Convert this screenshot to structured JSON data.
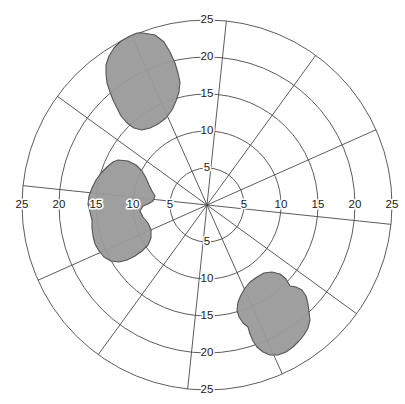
{
  "chart_data": {
    "type": "polar-region",
    "title": "",
    "subtitle": "",
    "xlabel": "",
    "ylabel": "",
    "grid": true,
    "legend": "none",
    "center": {
      "x": 207,
      "y": 205
    },
    "outer_radius_px": 185,
    "radial_axis": {
      "min": 0,
      "max": 25,
      "tick_step": 5,
      "tick_values": [
        5,
        10,
        15,
        20,
        25
      ],
      "tick_labels": [
        "5",
        "10",
        "15",
        "20",
        "25"
      ]
    },
    "angular_axis": {
      "spoke_count": 12,
      "spoke_step_deg": 30,
      "rotation_deg": 6,
      "labeled_directions": [
        "up",
        "down",
        "left",
        "right"
      ]
    },
    "axis_tick_labels": {
      "up": [
        "5",
        "10",
        "15",
        "20",
        "25"
      ],
      "down": [
        "5",
        "10",
        "15",
        "20",
        "25"
      ],
      "left": [
        "5",
        "10",
        "15",
        "20",
        "25"
      ],
      "right": [
        "5",
        "10",
        "15",
        "20",
        "25"
      ]
    },
    "colors": {
      "grid": "#4a4a4a",
      "background": "#ffffff",
      "region_fill": "#9a9a9a",
      "region_stroke": "#555555",
      "text": "#1a1a1a"
    },
    "series": [
      {
        "name": "region-upper-left",
        "fill": "#9a9a9a",
        "opacity": 0.95,
        "approx_centroid_r": 17.5,
        "approx_centroid_theta_deg": 113,
        "points": [
          [
            143,
            33
          ],
          [
            155,
            35
          ],
          [
            164,
            42
          ],
          [
            170,
            52
          ],
          [
            175,
            63
          ],
          [
            178,
            73
          ],
          [
            180,
            82
          ],
          [
            179,
            92
          ],
          [
            176,
            101
          ],
          [
            172,
            110
          ],
          [
            166,
            118
          ],
          [
            158,
            124
          ],
          [
            150,
            128
          ],
          [
            142,
            130
          ],
          [
            134,
            128
          ],
          [
            127,
            123
          ],
          [
            121,
            116
          ],
          [
            117,
            108
          ],
          [
            113,
            100
          ],
          [
            110,
            92
          ],
          [
            107,
            83
          ],
          [
            106,
            74
          ],
          [
            106,
            65
          ],
          [
            109,
            56
          ],
          [
            114,
            48
          ],
          [
            121,
            41
          ],
          [
            130,
            36
          ],
          [
            137,
            33
          ]
        ]
      },
      {
        "name": "region-left",
        "fill": "#9a9a9a",
        "opacity": 0.95,
        "approx_centroid_r": 12.5,
        "approx_centroid_theta_deg": 182,
        "points": [
          [
            118,
            160
          ],
          [
            128,
            161
          ],
          [
            136,
            165
          ],
          [
            142,
            171
          ],
          [
            146,
            178
          ],
          [
            149,
            185
          ],
          [
            152,
            191
          ],
          [
            155,
            196
          ],
          [
            153,
            201
          ],
          [
            148,
            204
          ],
          [
            143,
            206
          ],
          [
            140,
            211
          ],
          [
            143,
            217
          ],
          [
            148,
            223
          ],
          [
            151,
            230
          ],
          [
            151,
            238
          ],
          [
            148,
            245
          ],
          [
            142,
            251
          ],
          [
            135,
            256
          ],
          [
            127,
            260
          ],
          [
            119,
            262
          ],
          [
            111,
            261
          ],
          [
            104,
            257
          ],
          [
            99,
            251
          ],
          [
            95,
            244
          ],
          [
            93,
            236
          ],
          [
            92,
            228
          ],
          [
            92,
            220
          ],
          [
            90,
            212
          ],
          [
            88,
            204
          ],
          [
            89,
            196
          ],
          [
            92,
            188
          ],
          [
            96,
            180
          ],
          [
            101,
            173
          ],
          [
            107,
            167
          ],
          [
            113,
            162
          ]
        ]
      },
      {
        "name": "region-lower-right",
        "fill": "#9a9a9a",
        "opacity": 0.95,
        "approx_centroid_r": 17.0,
        "approx_centroid_theta_deg": -58,
        "points": [
          [
            272,
            272
          ],
          [
            280,
            274
          ],
          [
            286,
            279
          ],
          [
            290,
            286
          ],
          [
            296,
            287
          ],
          [
            302,
            290
          ],
          [
            306,
            296
          ],
          [
            308,
            304
          ],
          [
            309,
            312
          ],
          [
            310,
            320
          ],
          [
            308,
            328
          ],
          [
            304,
            335
          ],
          [
            299,
            341
          ],
          [
            293,
            347
          ],
          [
            286,
            352
          ],
          [
            278,
            355
          ],
          [
            270,
            355
          ],
          [
            263,
            352
          ],
          [
            257,
            347
          ],
          [
            253,
            341
          ],
          [
            250,
            334
          ],
          [
            248,
            327
          ],
          [
            243,
            323
          ],
          [
            239,
            317
          ],
          [
            237,
            310
          ],
          [
            238,
            302
          ],
          [
            241,
            295
          ],
          [
            245,
            288
          ],
          [
            250,
            282
          ],
          [
            257,
            277
          ],
          [
            264,
            273
          ]
        ]
      }
    ]
  }
}
